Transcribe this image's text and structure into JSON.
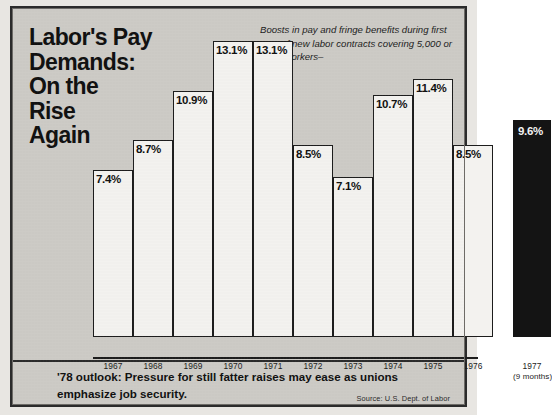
{
  "headline": {
    "lines": [
      "Labor's Pay",
      "Demands:",
      "On the",
      "Rise",
      "Again"
    ]
  },
  "caption": "Boosts in pay and fringe benefits during first year of new labor contracts covering 5,000 or more workers–",
  "average_label": "Average Increase",
  "footer": {
    "lead": "'78 outlook:",
    "body": " Pressure for still fatter raises may ease as unions emphasize job security.",
    "source": "Source: U.S. Dept. of Labor"
  },
  "colors": {
    "paper": "#cdcbc6",
    "frame": "#2b2b2b",
    "bar_fill": "#f3f2ef",
    "bar_outline": "#1d1d1d",
    "highlight_bar": "#141414"
  },
  "chart_data": {
    "type": "bar",
    "subtitle": "Boosts in pay and fringe benefits during first year of new labor contracts covering 5,000 or more workers–",
    "xlabel": "",
    "ylabel": "Average Increase",
    "ylim": [
      0,
      14
    ],
    "grid": false,
    "legend": "none",
    "source": "Source: U.S. Dept. of Labor",
    "categories": [
      "1967",
      "1968",
      "1969",
      "1970",
      "1971",
      "1972",
      "1973",
      "1974",
      "1975",
      "1976",
      "1977"
    ],
    "values": [
      7.4,
      8.7,
      10.9,
      13.1,
      13.1,
      8.5,
      7.1,
      10.7,
      11.4,
      8.5,
      9.6
    ],
    "data_labels": [
      "7.4%",
      "8.7%",
      "10.9%",
      "13.1%",
      "13.1%",
      "8.5%",
      "7.1%",
      "10.7%",
      "11.4%",
      "8.5%",
      "9.6%"
    ],
    "notes": [
      "1977 value covers 9 months and is drawn as a separate filled black bar"
    ],
    "annotations": [
      {
        "text": "Average Increase",
        "position": "inside-plot-lower-left"
      },
      {
        "text": "(9 months)",
        "position": "under-1977-tick"
      }
    ],
    "bars": [
      {
        "year": "1967",
        "label": "7.4%",
        "value": 7.4,
        "sub": "",
        "highlight": false,
        "x": 62,
        "w": 40
      },
      {
        "year": "1968",
        "label": "8.7%",
        "value": 8.7,
        "sub": "",
        "highlight": false,
        "x": 102,
        "w": 40
      },
      {
        "year": "1969",
        "label": "10.9%",
        "value": 10.9,
        "sub": "",
        "highlight": false,
        "x": 142,
        "w": 40
      },
      {
        "year": "1970",
        "label": "13.1%",
        "value": 13.1,
        "sub": "",
        "highlight": false,
        "x": 182,
        "w": 40
      },
      {
        "year": "1971",
        "label": "13.1%",
        "value": 13.1,
        "sub": "",
        "highlight": false,
        "x": 222,
        "w": 40
      },
      {
        "year": "1972",
        "label": "8.5%",
        "value": 8.5,
        "sub": "",
        "highlight": false,
        "x": 262,
        "w": 40
      },
      {
        "year": "1973",
        "label": "7.1%",
        "value": 7.1,
        "sub": "",
        "highlight": false,
        "x": 302,
        "w": 40
      },
      {
        "year": "1974",
        "label": "10.7%",
        "value": 10.7,
        "sub": "",
        "highlight": false,
        "x": 342,
        "w": 40
      },
      {
        "year": "1975",
        "label": "11.4%",
        "value": 11.4,
        "sub": "",
        "highlight": false,
        "x": 382,
        "w": 40
      },
      {
        "year": "1976",
        "label": "8.5%",
        "value": 8.5,
        "sub": "",
        "highlight": false,
        "x": 422,
        "w": 40
      },
      {
        "year": "1977",
        "label": "9.6%",
        "value": 9.6,
        "sub": "(9 months)",
        "highlight": true,
        "x": 482,
        "w": 38
      }
    ]
  }
}
